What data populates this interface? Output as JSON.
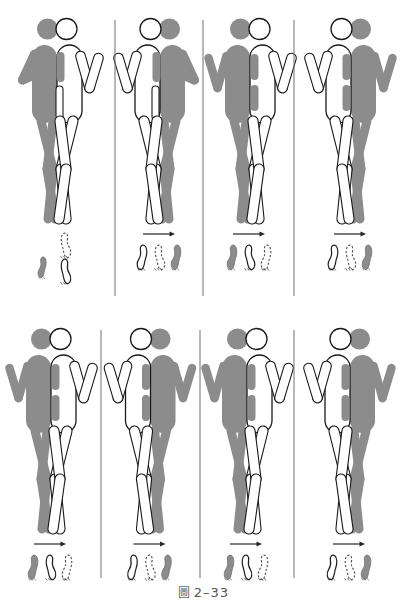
{
  "figure": {
    "caption_mark": "圖",
    "caption_label": "2–33",
    "caption_full": "圖 2–33",
    "type": "gait-phase-diagram",
    "title_text": "",
    "colors": {
      "limb_gray": "#8c8c8c",
      "limb_white": "#ffffff",
      "outline": "#1a1a1a",
      "divider": "#707070",
      "caption_text": "#555555",
      "footprint_dashed": "#4d4d4d",
      "background": "#ffffff"
    },
    "rows": [
      {
        "row_index": 1,
        "panels": [
          {
            "id": "panel-1",
            "label": "1",
            "near_side": "gray-left",
            "head_gray_side": "left",
            "arms": "near-arm-flexed-across-body",
            "arm_pose": "flexed",
            "stance": "single-support-heel-contact",
            "has_arrow": false,
            "arrow_direction": "",
            "footprints": [
              {
                "style": "gray",
                "label": "gray-foot"
              },
              {
                "style": "white",
                "label": "white-foot"
              },
              {
                "style": "dashed",
                "label": "dashed-foot"
              }
            ],
            "footprint_layout": "staggered"
          },
          {
            "id": "panel-2",
            "label": "2",
            "near_side": "white-left",
            "head_gray_side": "right",
            "arms": "near-arm-flexed-across-body",
            "arm_pose": "flexed",
            "stance": "single-support-heel-contact",
            "has_arrow": true,
            "arrow_direction": "right",
            "footprints": [
              {
                "style": "white",
                "label": "white-foot"
              },
              {
                "style": "dashed",
                "label": "dashed-foot"
              },
              {
                "style": "gray",
                "label": "gray-foot"
              }
            ],
            "footprint_layout": "inline"
          },
          {
            "id": "panel-3",
            "label": "3",
            "near_side": "gray-left",
            "head_gray_side": "left",
            "arms": "both-arms-abducted-v",
            "arm_pose": "abducted",
            "stance": "double-support",
            "has_arrow": true,
            "arrow_direction": "right",
            "footprints": [
              {
                "style": "gray",
                "label": "gray-foot"
              },
              {
                "style": "white",
                "label": "white-foot"
              },
              {
                "style": "dashed",
                "label": "dashed-foot"
              }
            ],
            "footprint_layout": "inline"
          },
          {
            "id": "panel-4",
            "label": "4",
            "near_side": "white-left",
            "head_gray_side": "right",
            "arms": "both-arms-abducted-v",
            "arm_pose": "abducted",
            "stance": "double-support",
            "has_arrow": true,
            "arrow_direction": "right",
            "footprints": [
              {
                "style": "white",
                "label": "white-foot"
              },
              {
                "style": "dashed",
                "label": "dashed-foot"
              },
              {
                "style": "gray",
                "label": "gray-foot"
              }
            ],
            "footprint_layout": "inline"
          }
        ]
      },
      {
        "row_index": 2,
        "panels": [
          {
            "id": "panel-5",
            "label": "5",
            "near_side": "gray-left",
            "head_gray_side": "left",
            "arms": "both-arms-abducted-v",
            "arm_pose": "abducted",
            "stance": "double-support",
            "has_arrow": true,
            "arrow_direction": "right",
            "footprints": [
              {
                "style": "gray",
                "label": "gray-foot"
              },
              {
                "style": "white",
                "label": "white-foot"
              },
              {
                "style": "dashed",
                "label": "dashed-foot"
              }
            ],
            "footprint_layout": "inline"
          },
          {
            "id": "panel-6",
            "label": "6",
            "near_side": "white-left",
            "head_gray_side": "right",
            "arms": "both-arms-abducted-v",
            "arm_pose": "abducted",
            "stance": "double-support",
            "has_arrow": true,
            "arrow_direction": "right",
            "footprints": [
              {
                "style": "white",
                "label": "white-foot"
              },
              {
                "style": "dashed",
                "label": "dashed-foot"
              },
              {
                "style": "gray",
                "label": "gray-foot"
              }
            ],
            "footprint_layout": "inline"
          },
          {
            "id": "panel-7",
            "label": "7",
            "near_side": "gray-left",
            "head_gray_side": "left",
            "arms": "both-arms-abducted-v",
            "arm_pose": "abducted",
            "stance": "double-support",
            "has_arrow": true,
            "arrow_direction": "right",
            "footprints": [
              {
                "style": "gray",
                "label": "gray-foot"
              },
              {
                "style": "white",
                "label": "white-foot"
              },
              {
                "style": "dashed",
                "label": "dashed-foot"
              }
            ],
            "footprint_layout": "inline"
          },
          {
            "id": "panel-8",
            "label": "8",
            "near_side": "white-left",
            "head_gray_side": "right",
            "arms": "both-arms-abducted-v",
            "arm_pose": "abducted",
            "stance": "double-support",
            "has_arrow": true,
            "arrow_direction": "right",
            "footprints": [
              {
                "style": "white",
                "label": "white-foot"
              },
              {
                "style": "dashed",
                "label": "dashed-foot"
              },
              {
                "style": "gray",
                "label": "gray-foot"
              }
            ],
            "footprint_layout": "inline"
          }
        ]
      }
    ],
    "dividers": {
      "row1_x": [
        115,
        203,
        294
      ],
      "row2_x": [
        101,
        200,
        294
      ],
      "row1_y": [
        20,
        296
      ],
      "row2_y": [
        330,
        578
      ]
    }
  }
}
